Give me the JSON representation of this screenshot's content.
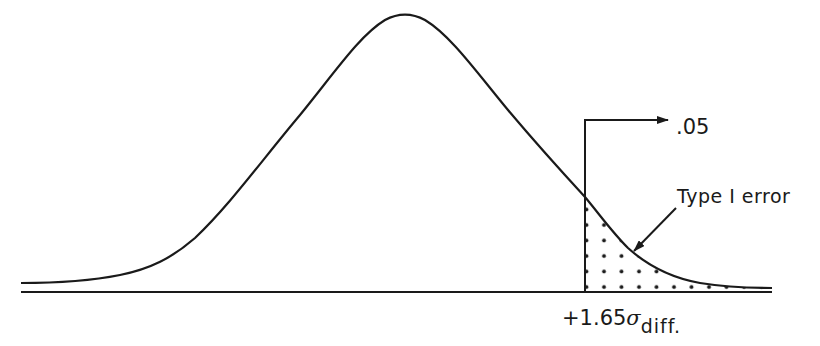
{
  "diagram": {
    "title": "",
    "type": "normal-distribution-one-tailed-test",
    "labels": {
      "alpha": ".05",
      "region": "Type I error",
      "cutoff_prefix": "+1.65",
      "cutoff_symbol": "σ",
      "cutoff_subscript": "diff."
    },
    "colors": {
      "stroke": "#1a1a1a",
      "background": "#ffffff",
      "dots": "#1a1a1a"
    }
  }
}
